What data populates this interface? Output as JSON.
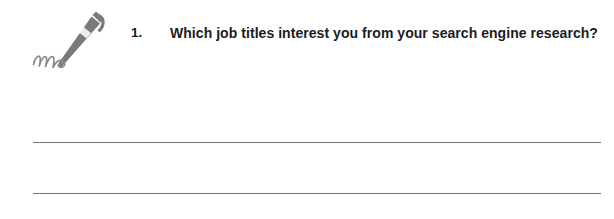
{
  "document": {
    "type": "worksheet-question",
    "background_color": "#ffffff"
  },
  "illustration": {
    "icon_name": "pen-signature-icon",
    "description": "Ballpoint pen drawing a cursive signature squiggle",
    "color": "#7a7a7a"
  },
  "question": {
    "number": "1.",
    "text": "Which job titles interest you from your search engine research?",
    "line_1": "Which job titles interest you from your search engine",
    "line_2": "research?",
    "text_color": "#1c1c1c"
  },
  "answer_area": {
    "line_count": 2,
    "line_color": "#6f6f6f",
    "lines": [
      {
        "label": "answer-line-1",
        "value": ""
      },
      {
        "label": "answer-line-2",
        "value": ""
      }
    ]
  }
}
